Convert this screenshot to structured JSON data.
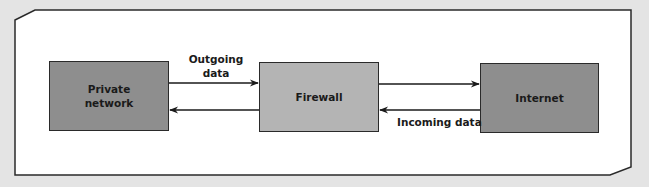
{
  "diagram": {
    "type": "network-flow",
    "nodes": [
      {
        "id": "private",
        "label": "Private\nnetwork",
        "fill": "#8e8e8e"
      },
      {
        "id": "firewall",
        "label": "Firewall",
        "fill": "#b4b4b4"
      },
      {
        "id": "internet",
        "label": "Internet",
        "fill": "#8e8e8e"
      }
    ],
    "edges": [
      {
        "from": "private",
        "to": "firewall",
        "direction": "right"
      },
      {
        "from": "firewall",
        "to": "private",
        "direction": "left"
      },
      {
        "from": "firewall",
        "to": "internet",
        "direction": "right"
      },
      {
        "from": "internet",
        "to": "firewall",
        "direction": "left"
      }
    ],
    "labels": {
      "outgoing_line1": "Outgoing",
      "outgoing_line2": "data",
      "incoming": "Incoming data"
    },
    "node_labels": {
      "private_line1": "Private",
      "private_line2": "network",
      "firewall": "Firewall",
      "internet": "Internet"
    },
    "colors": {
      "background": "#e4e4e4",
      "panel": "#ffffff",
      "dark_box": "#8e8e8e",
      "light_box": "#b4b4b4",
      "stroke": "#2a2a2a"
    }
  }
}
